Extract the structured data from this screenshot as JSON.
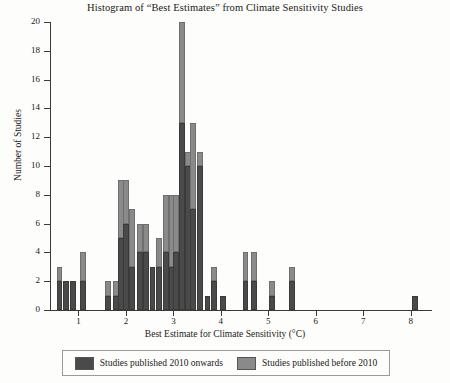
{
  "chart_data": {
    "type": "bar",
    "title": "Histogram of “Best Estimates” from Climate Sensitivity Studies",
    "xlabel": "Best Estimate for Climate Sensitivity (°C)",
    "ylabel": "Number of Studies",
    "xlim": [
      0.4,
      8.45
    ],
    "ylim": [
      0,
      20
    ],
    "grid": false,
    "bin_width": 0.2,
    "legend_position": "below-axes",
    "xticks": [
      1,
      2,
      3,
      4,
      5,
      6,
      7,
      8
    ],
    "xtick_labels": [
      "1",
      "2",
      "3",
      "4",
      "5",
      "6",
      "7",
      "8"
    ],
    "yticks": [
      0,
      2,
      4,
      6,
      8,
      10,
      12,
      14,
      16,
      18,
      20
    ],
    "ytick_labels": [
      "0",
      "2",
      "4",
      "6",
      "8",
      "10",
      "12",
      "14",
      "16",
      "18",
      "20"
    ],
    "series": [
      {
        "name": "Studies published 2010 onwards",
        "color": "#4a4a4a",
        "values": [
          2,
          2,
          0,
          0,
          0,
          2,
          0,
          0,
          0,
          0,
          1,
          5,
          6,
          3,
          4,
          4,
          3,
          4,
          5,
          4,
          7,
          13,
          7,
          9,
          9,
          1,
          3,
          0,
          2,
          2,
          0,
          1,
          0,
          2,
          0,
          0,
          0,
          0,
          0,
          0,
          0,
          0,
          0,
          0,
          0,
          0,
          0,
          0,
          0,
          0,
          0,
          0,
          0,
          0,
          0,
          0,
          0,
          0,
          0,
          0,
          0,
          0,
          0,
          0,
          0,
          0,
          0,
          0,
          0,
          0,
          0,
          0,
          0,
          0,
          0,
          0,
          1
        ]
      },
      {
        "name": "Studies published before 2010",
        "color": "#8a8a8a",
        "values": [
          1,
          0,
          0,
          0,
          0,
          2,
          0,
          0,
          0,
          0,
          1,
          4,
          3,
          4,
          2,
          4,
          0,
          4,
          3,
          3,
          3,
          7,
          3,
          1,
          1,
          0,
          1,
          0,
          2,
          2,
          0,
          1,
          0,
          0,
          0,
          0,
          0,
          0,
          0,
          0,
          0,
          0,
          0,
          0,
          0,
          0,
          0,
          0,
          0,
          0,
          0,
          0,
          0,
          0,
          0,
          0,
          0,
          0,
          0,
          0,
          0,
          0,
          0,
          0,
          0,
          0,
          0,
          0,
          0,
          0,
          0,
          0,
          0,
          0,
          0,
          0,
          0
        ]
      }
    ],
    "bins": [
      {
        "x": 0.6,
        "new": 2,
        "old": 1
      },
      {
        "x": 0.8,
        "new": 2,
        "old": 0
      },
      {
        "x": 1.0,
        "new": 0,
        "old": 0
      },
      {
        "x": 1.2,
        "new": 0,
        "old": 0
      },
      {
        "x": 1.4,
        "new": 0,
        "old": 0
      },
      {
        "x": 1.0,
        "new": 2,
        "old": 2
      },
      {
        "x": 1.6,
        "new": 0,
        "old": 0
      },
      {
        "x": 1.7,
        "new": 1,
        "old": 1
      },
      {
        "x": 1.9,
        "new": 5,
        "old": 4
      },
      {
        "x": 2.1,
        "new": 6,
        "old": 3
      },
      {
        "x": 2.3,
        "new": 3,
        "old": 4
      },
      {
        "x": 2.5,
        "new": 4,
        "old": 2
      },
      {
        "x": 2.7,
        "new": 4,
        "old": 4
      },
      {
        "x": 2.9,
        "new": 3,
        "old": 0
      },
      {
        "x": 3.1,
        "new": 4,
        "old": 4
      },
      {
        "x": 3.3,
        "new": 5,
        "old": 3
      },
      {
        "x": 3.5,
        "new": 4,
        "old": 3
      },
      {
        "x": 3.7,
        "new": 7,
        "old": 3
      },
      {
        "x": 3.9,
        "new": 13,
        "old": 7
      },
      {
        "x": 4.1,
        "new": 7,
        "old": 3
      },
      {
        "x": 4.3,
        "new": 9,
        "old": 1
      },
      {
        "x": 4.5,
        "new": 9,
        "old": 1
      },
      {
        "x": 4.7,
        "new": 1,
        "old": 0
      },
      {
        "x": 4.9,
        "new": 3,
        "old": 1
      },
      {
        "x": 5.1,
        "new": 2,
        "old": 2
      },
      {
        "x": 5.3,
        "new": 2,
        "old": 2
      },
      {
        "x": 5.5,
        "new": 1,
        "old": 1
      },
      {
        "x": 5.7,
        "new": 2,
        "old": 0
      },
      {
        "x": 8.1,
        "new": 1,
        "old": 0
      }
    ],
    "bars": [
      {
        "center": 0.6,
        "dark": 2,
        "light": 1,
        "total": 3
      },
      {
        "center": 0.74,
        "dark": 2,
        "light": 0,
        "total": 2
      },
      {
        "center": 0.88,
        "dark": 2,
        "light": 0,
        "total": 2
      },
      {
        "center": 1.1,
        "dark": 2,
        "light": 2,
        "total": 4
      },
      {
        "center": 1.62,
        "dark": 1,
        "light": 1,
        "total": 2
      },
      {
        "center": 1.8,
        "dark": 1,
        "light": 1,
        "total": 2
      },
      {
        "center": 1.9,
        "dark": 5,
        "light": 4,
        "total": 9
      },
      {
        "center": 2.0,
        "dark": 6,
        "light": 3,
        "total": 9
      },
      {
        "center": 2.12,
        "dark": 3,
        "light": 4,
        "total": 7
      },
      {
        "center": 2.3,
        "dark": 4,
        "light": 2,
        "total": 6
      },
      {
        "center": 2.42,
        "dark": 4,
        "light": 2,
        "total": 6
      },
      {
        "center": 2.56,
        "dark": 3,
        "light": 0,
        "total": 3
      },
      {
        "center": 2.7,
        "dark": 3,
        "light": 2,
        "total": 5
      },
      {
        "center": 2.84,
        "dark": 4,
        "light": 4,
        "total": 8
      },
      {
        "center": 2.96,
        "dark": 3,
        "light": 5,
        "total": 8
      },
      {
        "center": 3.06,
        "dark": 4,
        "light": 4,
        "total": 8
      },
      {
        "center": 3.18,
        "dark": 13,
        "light": 7,
        "total": 20
      },
      {
        "center": 3.3,
        "dark": 10,
        "light": 1,
        "total": 11
      },
      {
        "center": 3.42,
        "dark": 7,
        "light": 6,
        "total": 13
      },
      {
        "center": 3.56,
        "dark": 10,
        "light": 1,
        "total": 11
      },
      {
        "center": 3.72,
        "dark": 1,
        "light": 0,
        "total": 1
      },
      {
        "center": 3.86,
        "dark": 2,
        "light": 1,
        "total": 3
      },
      {
        "center": 4.04,
        "dark": 1,
        "light": 0,
        "total": 1
      },
      {
        "center": 4.52,
        "dark": 2,
        "light": 2,
        "total": 4
      },
      {
        "center": 4.7,
        "dark": 2,
        "light": 2,
        "total": 4
      },
      {
        "center": 5.08,
        "dark": 1,
        "light": 1,
        "total": 2
      },
      {
        "center": 5.5,
        "dark": 2,
        "light": 1,
        "total": 3
      },
      {
        "center": 8.1,
        "dark": 1,
        "light": 0,
        "total": 1
      }
    ]
  },
  "legend": {
    "entries": [
      {
        "label": "Studies published 2010 onwards",
        "color": "#4a4a4a"
      },
      {
        "label": "Studies published before 2010",
        "color": "#8a8a8a"
      }
    ]
  }
}
